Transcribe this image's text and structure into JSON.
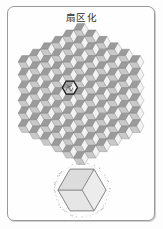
{
  "page": {
    "title": "扇区化",
    "background_color": "#fdfdfd",
    "frame_color": "#9a9a9a"
  },
  "figure": {
    "name": "hexagonal-rhombille-tiling",
    "description": "扇区化",
    "outer_shape": "hexagon",
    "tiling_type": "rhombille (tumbling blocks)",
    "rings": 5,
    "cell_count": 61,
    "rhombus_per_cell": 3,
    "boundary_style": "stippled-dotted",
    "highlighted_cell": {
      "name": "selected-sector",
      "ring": 1,
      "index": 3,
      "outline_color": "#1a1a1a",
      "outline_width": 1.2
    },
    "colors": {
      "face_top": "#f2f2f2",
      "face_left": "#9b9b9b",
      "face_right": "#c9c9c9",
      "edge": "#6f6f6f",
      "stipple": "#8d8d8d"
    },
    "geometry": {
      "center_x": 72,
      "center_y": 70,
      "cell_radius": 7.4
    }
  },
  "inset": {
    "name": "single-sector-cube",
    "description": "single hexagonal sector drawn as isometric cube",
    "colors": {
      "face_top": "#ececec",
      "face_left": "#dcdcdc",
      "face_right": "#e6e6e6",
      "edge": "#7a7a7a",
      "stipple": "#9a9a9a"
    },
    "geometry": {
      "center_x": 35,
      "center_y": 27,
      "radius": 24
    }
  }
}
